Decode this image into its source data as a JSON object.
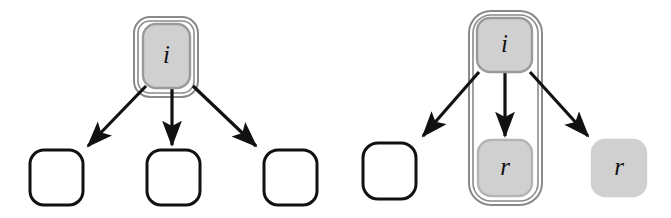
{
  "figure": {
    "type": "diagram",
    "kind": "two-panel node-and-arrow diagram",
    "background_color": "#ffffff",
    "palette": {
      "node_fill_gray": "#d0d0d0",
      "node_fill_white": "#ffffff",
      "node_stroke_gray": "#9a9a9a",
      "node_stroke_black": "#111111",
      "container_stroke": "#8a8a8a",
      "arrow_color": "#111111",
      "label_color": "#111111"
    },
    "panels": [
      {
        "id": "left-panel",
        "name": "left-diagram",
        "container": {
          "name": "left-group-container",
          "shape": "rounded-rectangle",
          "fill": "#ffffff",
          "stroke": "#8a8a8a",
          "encloses": [
            "left-root-node"
          ],
          "x": 134,
          "y": 17,
          "width": 64,
          "height": 80,
          "radius": 16
        },
        "nodes": [
          {
            "id": "left-root-node",
            "name": "node-i-left",
            "label": "i",
            "fill": "#d0d0d0",
            "stroke": "#9a9a9a",
            "x": 143,
            "y": 24,
            "width": 47,
            "height": 64,
            "radius": 13
          },
          {
            "id": "left-child-1",
            "name": "node-empty-left-1",
            "label": "",
            "fill": "#ffffff",
            "stroke": "#111111",
            "x": 30,
            "y": 150,
            "width": 53,
            "height": 55,
            "radius": 14
          },
          {
            "id": "left-child-2",
            "name": "node-empty-left-2",
            "label": "",
            "fill": "#ffffff",
            "stroke": "#111111",
            "x": 147,
            "y": 150,
            "width": 53,
            "height": 55,
            "radius": 14
          },
          {
            "id": "left-child-3",
            "name": "node-empty-left-3",
            "label": "",
            "fill": "#ffffff",
            "stroke": "#111111",
            "x": 264,
            "y": 150,
            "width": 53,
            "height": 55,
            "radius": 14
          }
        ],
        "arrows": [
          {
            "name": "arrow-left-1",
            "from": "left-root-node",
            "to": "left-child-1",
            "x1": 146,
            "y1": 86,
            "x2": 88,
            "y2": 146
          },
          {
            "name": "arrow-left-2",
            "from": "left-root-node",
            "to": "left-child-2",
            "x1": 172,
            "y1": 86,
            "x2": 172,
            "y2": 145
          },
          {
            "name": "arrow-left-3",
            "from": "left-root-node",
            "to": "left-child-3",
            "x1": 193,
            "y1": 86,
            "x2": 256,
            "y2": 146
          }
        ]
      },
      {
        "id": "right-panel",
        "name": "right-diagram",
        "container": {
          "name": "right-group-container",
          "shape": "rounded-rectangle",
          "fill": "#ffffff",
          "stroke": "#8a8a8a",
          "encloses": [
            "right-root-node",
            "right-child-center"
          ],
          "x": 469,
          "y": 11,
          "width": 73,
          "height": 194,
          "radius": 22
        },
        "nodes": [
          {
            "id": "right-root-node",
            "name": "node-i-right",
            "label": "i",
            "fill": "#d0d0d0",
            "stroke": "#9a9a9a",
            "x": 477,
            "y": 18,
            "width": 55,
            "height": 54,
            "radius": 13
          },
          {
            "id": "right-child-left",
            "name": "node-empty-right",
            "label": "",
            "fill": "#ffffff",
            "stroke": "#111111",
            "x": 363,
            "y": 143,
            "width": 53,
            "height": 56,
            "radius": 15
          },
          {
            "id": "right-child-center",
            "name": "node-r-center",
            "label": "r",
            "fill": "#d0d0d0",
            "stroke": "#b4b4b4",
            "x": 478,
            "y": 140,
            "width": 54,
            "height": 56,
            "radius": 13
          },
          {
            "id": "right-child-right",
            "name": "node-r-right",
            "label": "r",
            "fill": "#d0d0d0",
            "stroke": "#d0d0d0",
            "x": 592,
            "y": 140,
            "width": 54,
            "height": 56,
            "radius": 13
          }
        ],
        "arrows": [
          {
            "name": "arrow-right-1",
            "from": "right-root-node",
            "to": "right-child-left",
            "x1": 479,
            "y1": 72,
            "x2": 423,
            "y2": 136
          },
          {
            "name": "arrow-right-2",
            "from": "right-root-node",
            "to": "right-child-center",
            "x1": 505,
            "y1": 73,
            "x2": 505,
            "y2": 136
          },
          {
            "name": "arrow-right-3",
            "from": "right-root-node",
            "to": "right-child-right",
            "x1": 530,
            "y1": 72,
            "x2": 588,
            "y2": 136
          }
        ]
      }
    ]
  }
}
